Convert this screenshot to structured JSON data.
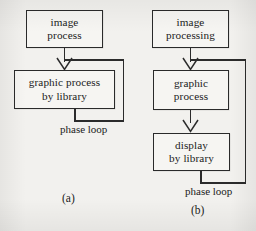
{
  "figure": {
    "background_color": "#f2f1ee",
    "stroke_color": "#2a2a2a",
    "text_color": "#1b1b1b"
  },
  "diagrams": [
    {
      "id": "a",
      "caption": "(a)",
      "loop_label": "phase loop",
      "nodes": [
        {
          "id": "a-image-process",
          "lines": [
            "image",
            "process"
          ]
        },
        {
          "id": "a-graphic-process-by-library",
          "lines": [
            "graphic process",
            "by library"
          ]
        }
      ],
      "edges": [
        {
          "from": "a-image-process",
          "to": "a-graphic-process-by-library",
          "kind": "arrow"
        },
        {
          "from": "a-graphic-process-by-library",
          "to": "a-graphic-process-by-library",
          "kind": "feedback"
        }
      ]
    },
    {
      "id": "b",
      "caption": "(b)",
      "loop_label": "phase loop",
      "nodes": [
        {
          "id": "b-image-processing",
          "lines": [
            "image",
            "processing"
          ]
        },
        {
          "id": "b-graphic-process",
          "lines": [
            "graphic",
            "process"
          ]
        },
        {
          "id": "b-display-by-library",
          "lines": [
            "display",
            "by library"
          ]
        }
      ],
      "edges": [
        {
          "from": "b-image-processing",
          "to": "b-graphic-process",
          "kind": "arrow"
        },
        {
          "from": "b-graphic-process",
          "to": "b-display-by-library",
          "kind": "arrow"
        },
        {
          "from": "b-display-by-library",
          "to": "b-graphic-process",
          "kind": "feedback"
        }
      ]
    }
  ]
}
